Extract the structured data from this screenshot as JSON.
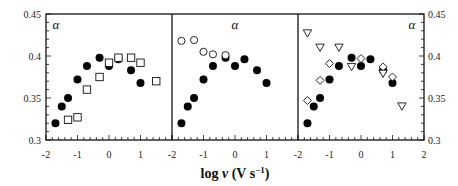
{
  "chart_data": {
    "type": "scatter",
    "xlabel": "log v (V s⁻¹)",
    "ylim": [
      0.3,
      0.45
    ],
    "yticks": [
      "0.3",
      "0.35",
      "0.4",
      "0.45"
    ],
    "xticks": [
      "-2",
      "-1",
      "0",
      "1"
    ],
    "xticks_last": [
      "-2",
      "-1",
      "0",
      "1",
      "2"
    ],
    "panels": [
      {
        "annotation": "α",
        "annotation_pos": "left",
        "xlim": [
          -2,
          2
        ],
        "series": [
          {
            "name": "filled-circle",
            "marker": "circle-filled",
            "x": [
              -1.7,
              -1.5,
              -1.3,
              -1.0,
              -0.7,
              -0.3,
              0.0,
              0.3,
              0.7,
              1.0
            ],
            "y": [
              0.32,
              0.34,
              0.35,
              0.372,
              0.388,
              0.398,
              0.388,
              0.396,
              0.383,
              0.368
            ]
          },
          {
            "name": "open-square",
            "marker": "square-open",
            "x": [
              -1.3,
              -1.0,
              -0.7,
              -0.3,
              0.0,
              0.3,
              0.7,
              1.0,
              1.5
            ],
            "y": [
              0.324,
              0.327,
              0.36,
              0.375,
              0.392,
              0.398,
              0.398,
              0.392,
              0.37
            ]
          }
        ]
      },
      {
        "annotation": "α",
        "annotation_pos": "center",
        "xlim": [
          -2,
          2
        ],
        "series": [
          {
            "name": "filled-circle",
            "marker": "circle-filled",
            "x": [
              -1.7,
              -1.5,
              -1.3,
              -1.0,
              -0.7,
              -0.3,
              0.0,
              0.3,
              0.7,
              1.0
            ],
            "y": [
              0.32,
              0.34,
              0.35,
              0.372,
              0.388,
              0.398,
              0.388,
              0.396,
              0.383,
              0.368
            ]
          },
          {
            "name": "open-circle",
            "marker": "circle-open",
            "x": [
              -1.7,
              -1.3,
              -1.0,
              -0.7,
              -0.3
            ],
            "y": [
              0.418,
              0.419,
              0.405,
              0.402,
              0.401
            ]
          }
        ]
      },
      {
        "annotation": "α",
        "annotation_pos": "right",
        "xlim": [
          -2,
          2
        ],
        "series": [
          {
            "name": "filled-circle",
            "marker": "circle-filled",
            "x": [
              -1.7,
              -1.5,
              -1.3,
              -1.0,
              -0.7,
              -0.3,
              0.0,
              0.3,
              0.7,
              1.0
            ],
            "y": [
              0.32,
              0.34,
              0.35,
              0.372,
              0.388,
              0.398,
              0.388,
              0.396,
              0.383,
              0.368
            ]
          },
          {
            "name": "open-diamond",
            "marker": "diamond-open",
            "x": [
              -1.7,
              -1.3,
              -1.0,
              0.0,
              0.7,
              1.0
            ],
            "y": [
              0.347,
              0.371,
              0.391,
              0.397,
              0.387,
              0.375
            ]
          },
          {
            "name": "open-triangle-down",
            "marker": "triangle-down-open",
            "x": [
              -1.7,
              -1.3,
              -0.7,
              -0.3,
              0.7,
              1.3
            ],
            "y": [
              0.427,
              0.41,
              0.41,
              0.387,
              0.379,
              0.34
            ]
          }
        ]
      }
    ]
  }
}
